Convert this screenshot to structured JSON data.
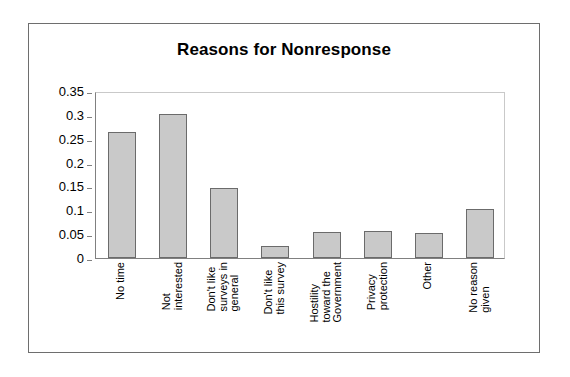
{
  "chart_data": {
    "type": "bar",
    "title": "Reasons for Nonresponse",
    "xlabel": "",
    "ylabel": "",
    "ylim": [
      0,
      0.35
    ],
    "grid": false,
    "legend": null,
    "ytick_labels": [
      "0.35",
      "0.3",
      "0.25",
      "0.2",
      "0.15",
      "0.1",
      "0.05",
      "0"
    ],
    "ytick_values": [
      0.35,
      0.3,
      0.25,
      0.2,
      0.15,
      0.1,
      0.05,
      0
    ],
    "categories": [
      "No time",
      "Not interested",
      "Don't like surveys in general",
      "Don't like this survey",
      "Hostility toward the Government",
      "Privacy protection",
      "Other",
      "No reason given"
    ],
    "category_lines": [
      [
        "No time"
      ],
      [
        "Not",
        "interested"
      ],
      [
        "Don't like",
        "surveys in",
        "general"
      ],
      [
        "Don't like",
        "this survey"
      ],
      [
        "Hostility",
        "toward the",
        "Government"
      ],
      [
        "Privacy",
        "protection"
      ],
      [
        "Other"
      ],
      [
        "No reason",
        "given"
      ]
    ],
    "values": [
      0.265,
      0.302,
      0.146,
      0.026,
      0.054,
      0.056,
      0.052,
      0.102
    ],
    "bar_fill_color": "#c9c9c9",
    "bar_edge_color": "#6b6b6b",
    "axis_color": "#808080",
    "frame_color": "#6e6e6e",
    "text_color": "#000000"
  }
}
